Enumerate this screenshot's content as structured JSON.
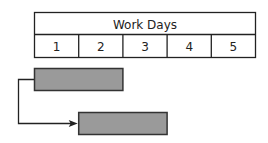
{
  "header": {
    "title": "Work Days",
    "days": [
      "1",
      "2",
      "3",
      "4",
      "5"
    ]
  },
  "tasks": [
    {
      "name": "task-1",
      "start_day": 1,
      "duration_days": 2
    },
    {
      "name": "task-2",
      "start_day": 2,
      "duration_days": 2
    }
  ],
  "dependency": {
    "from": "task-1",
    "to": "task-2",
    "type": "start-to-start"
  },
  "colors": {
    "bar_fill": "#9a9a9a",
    "bar_stroke": "#333333",
    "line": "#222222",
    "text": "#222222"
  }
}
